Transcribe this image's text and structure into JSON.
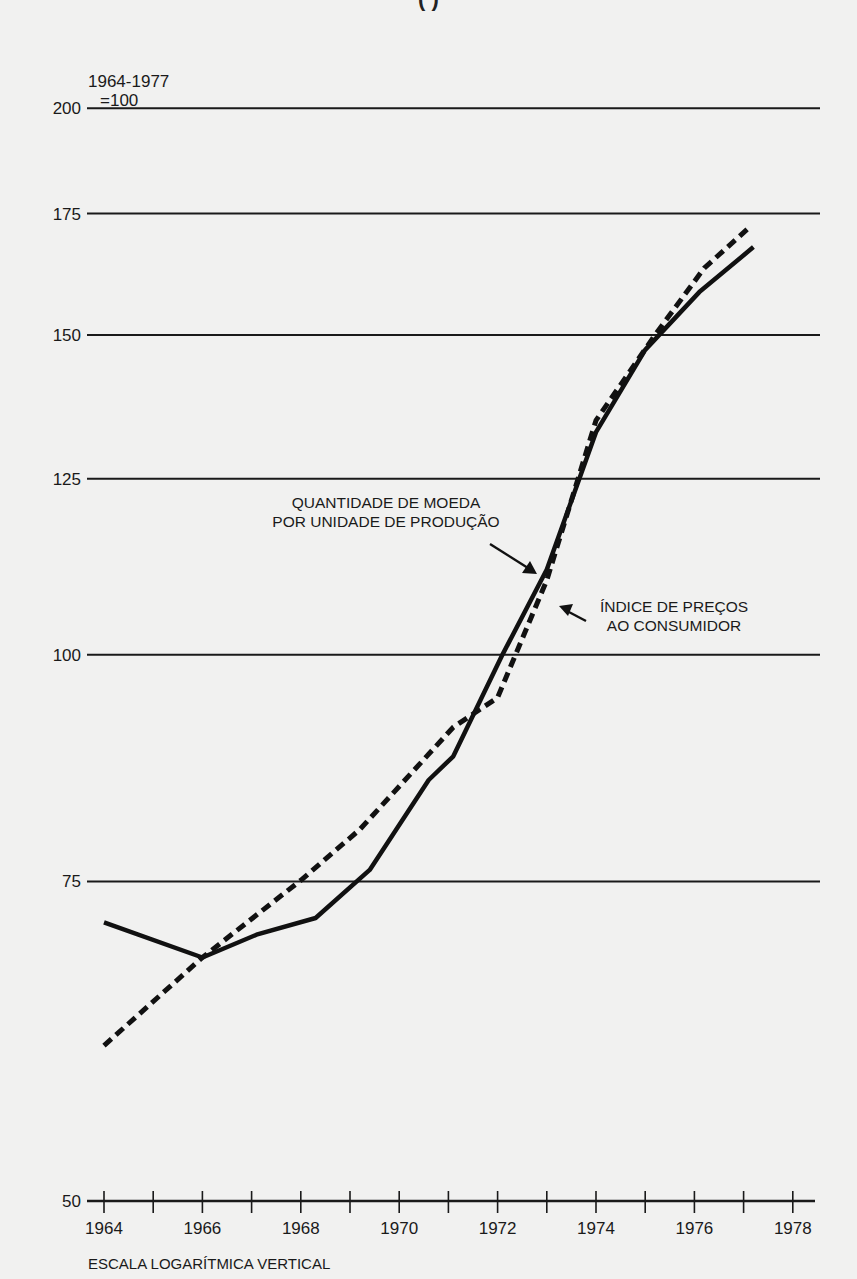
{
  "title_clipped": "(                    )",
  "chart_data": {
    "type": "line",
    "title": "",
    "xlabel": "",
    "ylabel": "1964-1977 =100",
    "y_unit_label_line1": "1964-1977",
    "y_unit_label_line2": "=100",
    "y_scale": "log",
    "ylim": [
      50,
      200
    ],
    "xlim": [
      1964,
      1978
    ],
    "grid": true,
    "y_ticks": [
      50,
      75,
      100,
      125,
      150,
      175,
      200
    ],
    "x_ticks": [
      1964,
      1965,
      1966,
      1967,
      1968,
      1969,
      1970,
      1971,
      1972,
      1973,
      1974,
      1975,
      1976,
      1977,
      1978
    ],
    "x_tick_labels": [
      "1964",
      "1966",
      "1968",
      "1970",
      "1972",
      "1974",
      "1976",
      "1978"
    ],
    "footnote": "ESCALA LOGARÍTMICA VERTICAL",
    "series": [
      {
        "name": "QUANTIDADE DE MOEDA POR UNIDADE DE PRODUÇÃO",
        "style": "solid",
        "x": [
          1964,
          1966,
          1967.1,
          1968.3,
          1969.4,
          1970.6,
          1971.1,
          1972.1,
          1973.0,
          1974.0,
          1975.0,
          1976.1,
          1977.2
        ],
        "values": [
          71.2,
          68.1,
          70.1,
          71.6,
          76.1,
          85.3,
          87.9,
          100,
          111.4,
          132.6,
          147.2,
          158.4,
          167.7
        ]
      },
      {
        "name": "ÍNDICE DE PREÇOS AO CONSUMIDOR",
        "style": "dashed",
        "x": [
          1964,
          1966,
          1968,
          1969.2,
          1971.1,
          1972.0,
          1973.0,
          1974.0,
          1975.2,
          1976.2,
          1977.1
        ],
        "values": [
          60.9,
          68.1,
          75.1,
          80.1,
          91.2,
          94.7,
          109.9,
          134.6,
          150,
          163.3,
          171.8
        ]
      }
    ],
    "annotations": [
      {
        "line1": "QUANTIDADE DE MOEDA",
        "line2": "POR UNIDADE DE PRODUÇÃO",
        "points_to": "solid"
      },
      {
        "line1": "ÍNDICE DE PREÇOS",
        "line2": "AO CONSUMIDOR",
        "points_to": "dashed"
      }
    ]
  }
}
